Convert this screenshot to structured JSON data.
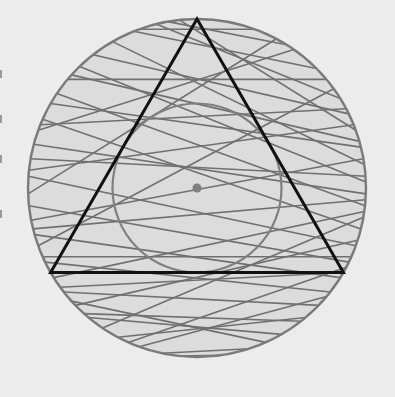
{
  "diagram": {
    "colors": {
      "background": "#ececec",
      "disk_fill": "#dcdcdc",
      "outer_circle": "#7a7a7a",
      "inner_circle": "#7f7f7f",
      "chord": "#707070",
      "triangle": "#111111",
      "center_point": "#808080"
    },
    "shapes": {
      "outer_circle": {
        "label": "outer circle"
      },
      "inner_circle": {
        "label": "incircle",
        "radius_ratio": 0.5
      },
      "triangle": {
        "label": "inscribed equilateral triangle",
        "vertex_angles_deg": [
          90,
          210,
          330
        ]
      },
      "center_point": {
        "label": "center"
      }
    },
    "chords": [
      {
        "a": 96,
        "b": 20
      },
      {
        "a": 104,
        "b": 32
      },
      {
        "a": 112,
        "b": 45
      },
      {
        "a": 120,
        "b": 8
      },
      {
        "a": 128,
        "b": 26
      },
      {
        "a": 134,
        "b": 2
      },
      {
        "a": 140,
        "b": 40
      },
      {
        "a": 146,
        "b": -6
      },
      {
        "a": 150,
        "b": 14
      },
      {
        "a": 156,
        "b": -14
      },
      {
        "a": 160,
        "b": 55
      },
      {
        "a": 165,
        "b": -2
      },
      {
        "a": 170,
        "b": 4
      },
      {
        "a": 176,
        "b": -20
      },
      {
        "a": 182,
        "b": 62
      },
      {
        "a": 186,
        "b": -26
      },
      {
        "a": 191,
        "b": 10
      },
      {
        "a": 196,
        "b": -32
      },
      {
        "a": 200,
        "b": 36
      },
      {
        "a": 206,
        "b": -38
      },
      {
        "a": 212,
        "b": -8
      },
      {
        "a": 218,
        "b": -44
      },
      {
        "a": 224,
        "b": -18
      },
      {
        "a": 230,
        "b": -60
      },
      {
        "a": 236,
        "b": -10
      },
      {
        "a": 242,
        "b": -50
      },
      {
        "a": 250,
        "b": -40
      },
      {
        "a": 258,
        "b": -72
      },
      {
        "a": 264,
        "b": -82
      },
      {
        "a": 222,
        "b": -66
      },
      {
        "a": 100,
        "b": 58
      },
      {
        "a": 110,
        "b": 70
      },
      {
        "a": 138,
        "b": 16
      },
      {
        "a": 158,
        "b": 28
      },
      {
        "a": 174,
        "b": 22
      },
      {
        "a": 194,
        "b": -4
      },
      {
        "a": 204,
        "b": -24
      },
      {
        "a": 216,
        "b": -30
      },
      {
        "a": 246,
        "b": -28
      },
      {
        "a": 228,
        "b": -52
      }
    ]
  }
}
